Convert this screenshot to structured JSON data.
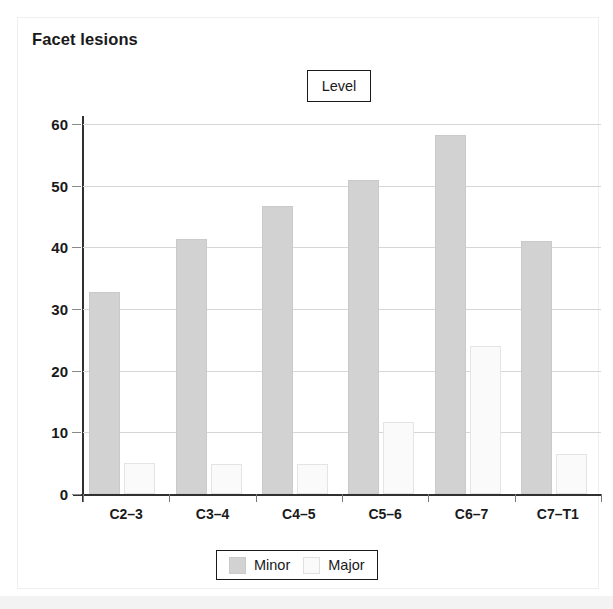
{
  "card": {
    "title": "Facet lesions",
    "level_box_label": "Level"
  },
  "legend": {
    "entries": [
      {
        "label": "Minor",
        "color": "#d2d2d2"
      },
      {
        "label": "Major",
        "color": "#fafafa"
      }
    ]
  },
  "chart_data": {
    "type": "bar",
    "title": "Facet lesions",
    "xlabel": "Level",
    "ylabel": "",
    "categories": [
      "C2–3",
      "C3–4",
      "C4–5",
      "C5–6",
      "C6–7",
      "C7–T1"
    ],
    "series": [
      {
        "name": "Minor",
        "color": "#d2d2d2",
        "values": [
          32.7,
          41.3,
          46.7,
          51.0,
          58.2,
          41.0
        ]
      },
      {
        "name": "Major",
        "color": "#fafafa",
        "values": [
          5.0,
          4.9,
          4.8,
          11.6,
          24.0,
          6.5
        ]
      }
    ],
    "ylim": [
      0,
      60
    ],
    "yticks": [
      0,
      10,
      20,
      30,
      40,
      50,
      60
    ],
    "ytick_labels": [
      "0",
      "10",
      "20",
      "30",
      "40",
      "50",
      "60"
    ],
    "grid": true,
    "legend_position": "bottom"
  }
}
